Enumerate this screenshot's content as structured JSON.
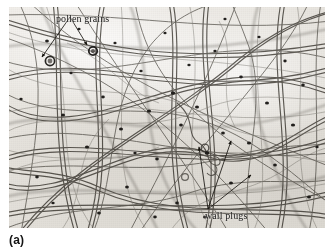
{
  "figure": {
    "panel_caption": "(a)",
    "image_kind": "light-micrograph"
  },
  "micrograph": {
    "background_color": "#e9e6e1",
    "fiber_color": "#4a4843",
    "node_color": "#262421",
    "annotation_color": "#1a1a1a",
    "frame": {
      "x": 9,
      "y": 7,
      "width": 316,
      "height": 221
    }
  },
  "annotations": [
    {
      "id": "pollen-grains",
      "label": "pollen grains",
      "x": 47,
      "y": 6,
      "leader_targets": [
        [
          58,
          62
        ],
        [
          92,
          52
        ]
      ]
    },
    {
      "id": "wall-plugs",
      "label": "wall plugs",
      "x": 196,
      "y": 203,
      "leader_targets": [
        [
          207,
          146
        ],
        [
          232,
          142
        ],
        [
          250,
          176
        ]
      ]
    }
  ]
}
